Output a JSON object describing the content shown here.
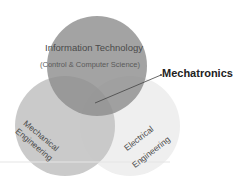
{
  "diagram": {
    "type": "venn",
    "circles": [
      {
        "id": "it",
        "label": "Information Technology",
        "sublabel": "(Control & Computer Science)",
        "color": "#8f8f8f"
      },
      {
        "id": "mechanical",
        "label_line1": "Mechanical",
        "label_line2": "Engineering",
        "color": "#c8c8c8"
      },
      {
        "id": "electrical",
        "label_line1": "Electrical",
        "label_line2": "Engineering",
        "color": "#eeeeee"
      }
    ],
    "intersection_label": "Mechatronics"
  }
}
